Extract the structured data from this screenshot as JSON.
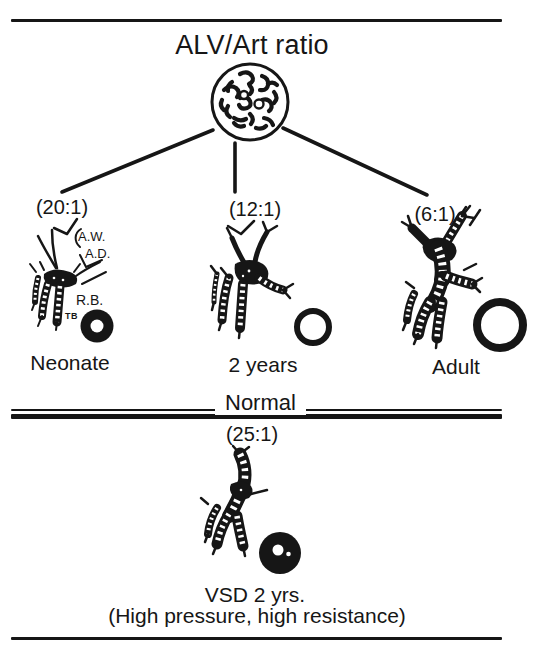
{
  "figure": {
    "title": "ALV/Art ratio",
    "divider_label": "Normal"
  },
  "panels": [
    {
      "ratio": "(20:1)",
      "age": "Neonate",
      "annotations": {
        "aw": "A.W.",
        "ad": "A.D.",
        "rb": "R.B.",
        "tb": "TB"
      }
    },
    {
      "ratio": "(12:1)",
      "age": "2 years"
    },
    {
      "ratio": "(6:1)",
      "age": "Adult"
    }
  ],
  "bottom_panel": {
    "ratio": "(25:1)",
    "caption_line1": "VSD 2 yrs.",
    "caption_line2": "(High pressure, high resistance)"
  },
  "colors": {
    "ink": "#161616",
    "paper": "#ffffff"
  }
}
